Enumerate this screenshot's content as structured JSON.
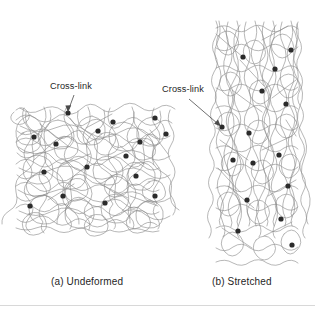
{
  "figure": {
    "title_visible": false,
    "background_color": "#ffffff",
    "chain_color": "#8a8a8a",
    "crosslink_color": "#2b2b2b",
    "leader_color": "#4a4a4a",
    "text_color": "#1f1f1f"
  },
  "annotations": {
    "crosslink_a": "Cross-link",
    "crosslink_b": "Cross-link"
  },
  "captions": {
    "a": "(a) Undeformed",
    "b": "(b) Stretched"
  },
  "panels": [
    {
      "id": "a",
      "caption": "(a) Undeformed",
      "state": "undeformed",
      "box": {
        "x": 16,
        "y": 106,
        "width": 156,
        "height": 126
      },
      "orientation": "isotropic-random-coil",
      "crosslink_count": 16,
      "crosslink_points": [
        [
          68,
          113
        ],
        [
          113,
          122
        ],
        [
          155,
          118
        ],
        [
          34,
          137
        ],
        [
          98,
          131
        ],
        [
          140,
          142
        ],
        [
          56,
          144
        ],
        [
          126,
          156
        ],
        [
          166,
          134
        ],
        [
          44,
          172
        ],
        [
          87,
          167
        ],
        [
          136,
          176
        ],
        [
          63,
          196
        ],
        [
          105,
          203
        ],
        [
          155,
          196
        ],
        [
          30,
          206
        ]
      ]
    },
    {
      "id": "b",
      "caption": "(b) Stretched",
      "state": "stretched",
      "box": {
        "x": 216,
        "y": 21,
        "width": 82,
        "height": 247
      },
      "orientation": "vertically-aligned-extended",
      "crosslink_count": 15,
      "crosslink_points": [
        [
          243,
          57
        ],
        [
          275,
          69
        ],
        [
          291,
          50
        ],
        [
          262,
          91
        ],
        [
          286,
          104
        ],
        [
          222,
          127
        ],
        [
          249,
          133
        ],
        [
          233,
          160
        ],
        [
          253,
          163
        ],
        [
          279,
          155
        ],
        [
          288,
          186
        ],
        [
          247,
          200
        ],
        [
          238,
          231
        ],
        [
          281,
          219
        ],
        [
          292,
          245
        ]
      ]
    }
  ],
  "leaders": [
    {
      "for": "crosslink_a",
      "from": [
        74,
        95
      ],
      "to": [
        68,
        112
      ]
    },
    {
      "for": "crosslink_b",
      "from": [
        189,
        99
      ],
      "to": [
        221,
        127
      ]
    }
  ]
}
